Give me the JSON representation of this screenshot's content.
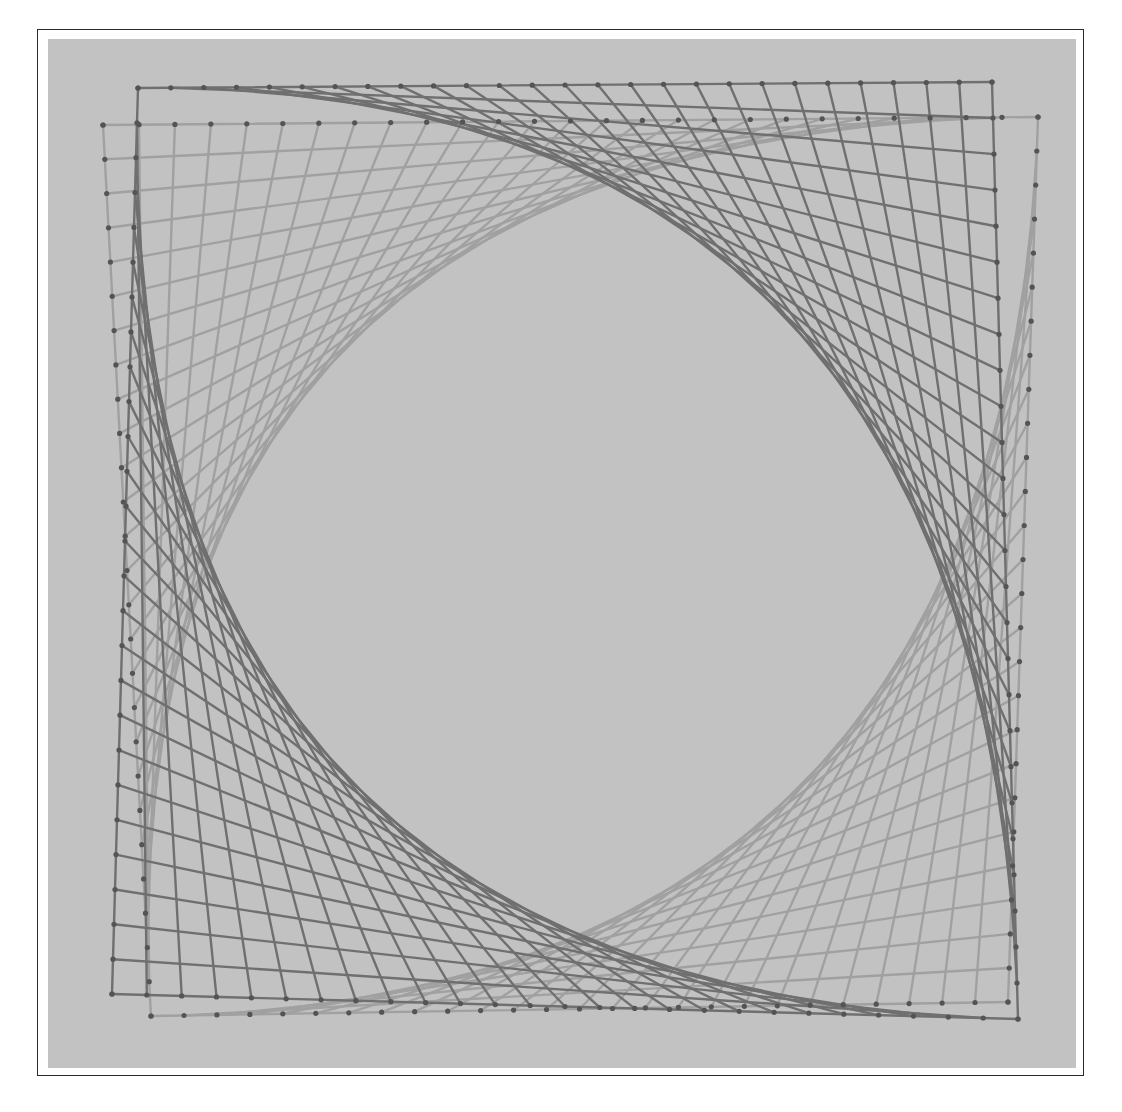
{
  "image": {
    "description": "Black-and-white photograph of string art: two slightly rotated nail squares with curve-stitched corners forming a rounded diamond void in the center",
    "background_color": "#c3c3c3",
    "frame_color": "#2a2a2a",
    "string_colors": {
      "light": "#9a9a9a",
      "dark": "#5e5e5e",
      "nail": "#3c3c3c"
    }
  },
  "art": {
    "nails_per_side": 26,
    "square_a": {
      "tone": "dark",
      "corners": {
        "tl": [
          90,
          49
        ],
        "tr": [
          944,
          43
        ],
        "br": [
          970,
          980
        ],
        "bl": [
          64,
          955
        ]
      },
      "stitched_corners": [
        "tr",
        "bl"
      ]
    },
    "square_b": {
      "tone": "light",
      "corners": {
        "tl": [
          55,
          86
        ],
        "tr": [
          990,
          78
        ],
        "br": [
          960,
          963
        ],
        "bl": [
          103,
          977
        ]
      },
      "stitched_corners": [
        "tl",
        "br"
      ]
    }
  }
}
